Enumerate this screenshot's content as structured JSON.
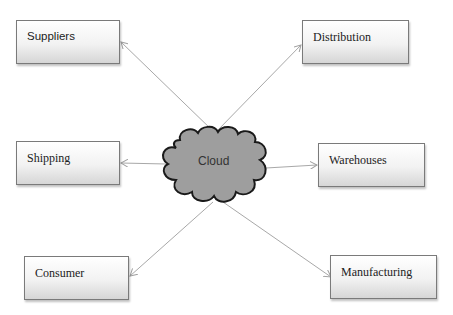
{
  "diagram": {
    "center": {
      "label": "Cloud",
      "fill": "#9e9e9e",
      "stroke": "#1a1a1a"
    },
    "nodes": [
      {
        "id": "suppliers",
        "label": "Suppliers"
      },
      {
        "id": "distribution",
        "label": "Distribution"
      },
      {
        "id": "shipping",
        "label": "Shipping"
      },
      {
        "id": "warehouses",
        "label": "Warehouses"
      },
      {
        "id": "consumer",
        "label": "Consumer"
      },
      {
        "id": "manufacturing",
        "label": "Manufacturing"
      }
    ],
    "edges": [
      {
        "from": "cloud",
        "to": "suppliers"
      },
      {
        "from": "cloud",
        "to": "distribution"
      },
      {
        "from": "cloud",
        "to": "shipping"
      },
      {
        "from": "cloud",
        "to": "warehouses"
      },
      {
        "from": "cloud",
        "to": "consumer"
      },
      {
        "from": "cloud",
        "to": "manufacturing"
      }
    ],
    "edge_color": "#a8a8a8"
  }
}
